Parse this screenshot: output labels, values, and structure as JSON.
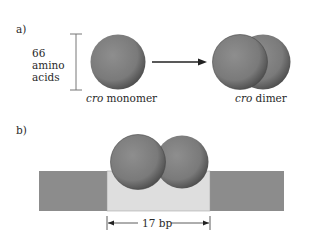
{
  "panel_a": {
    "label": "a)",
    "size_label_line1": "66",
    "size_label_line2": "amino",
    "size_label_line3": "acids",
    "monomer_italic": "cro",
    "monomer_text": " monomer",
    "dimer_italic": "cro",
    "dimer_text": " dimer"
  },
  "panel_b": {
    "label": "b)",
    "span_label": "17 bp"
  },
  "colors": {
    "sphere": "#7d7d7d",
    "sphere_dark": "#4a4a4a",
    "dna_dark": "#8a8a8a",
    "dna_light": "#dcdcdc",
    "line": "#333333"
  }
}
